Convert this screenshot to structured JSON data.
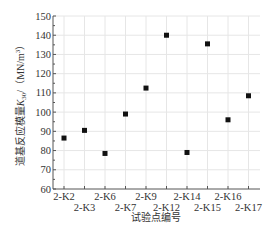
{
  "chart_data": {
    "type": "scatter",
    "title": "",
    "xlabel": "试验点编号",
    "ylabel": "道基反应模量K₃₀/（MN/m³）",
    "ylabel_main": "道基反应模量",
    "ylabel_symbol": "K",
    "ylabel_sub": "30",
    "ylabel_unit": "/（MN/m",
    "ylabel_unit_sup": "3",
    "ylabel_unit_close": "）",
    "categories": [
      "2-K2",
      "2-K3",
      "2-K6",
      "2-K7",
      "2-K9",
      "2-K12",
      "2-K14",
      "2-K15",
      "2-K16",
      "2-K17"
    ],
    "values": [
      86.5,
      90.5,
      78.5,
      99,
      112.5,
      140,
      79,
      135.5,
      96,
      108.5
    ],
    "ylim": [
      60,
      150
    ],
    "yticks": [
      60,
      70,
      80,
      90,
      100,
      110,
      120,
      130,
      140,
      150
    ],
    "grid": true,
    "legend": null,
    "marker": "square",
    "marker_color": "#111111",
    "grid_color": "#e6e6e6",
    "axis_color": "#555555"
  }
}
